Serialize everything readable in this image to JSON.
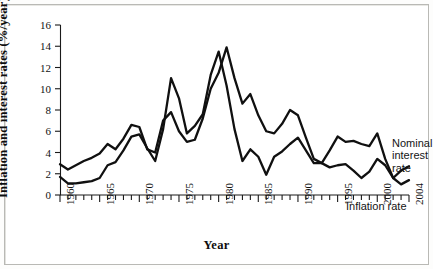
{
  "figure": {
    "ylabel": "Inflation and interest rates (%/year)",
    "xlabel": "Year",
    "annotations": {
      "nominal": "Nominal\ninterest rate",
      "inflation": "Inflation rate"
    }
  },
  "chart_data": {
    "type": "line",
    "title": "",
    "xlabel": "Year",
    "ylabel": "Inflation and interest rates (%/year)",
    "xlim": [
      1960,
      2004
    ],
    "ylim": [
      0,
      16
    ],
    "ytick_labels": [
      "0",
      "2",
      "4",
      "6",
      "8",
      "10",
      "12",
      "14",
      "16"
    ],
    "yticks": [
      0,
      2,
      4,
      6,
      8,
      10,
      12,
      14,
      16
    ],
    "xtick_labels": [
      "1960",
      "1965",
      "1970",
      "1975",
      "1980",
      "1985",
      "1990",
      "1995",
      "2000",
      "2004"
    ],
    "xticks": [
      1960,
      1965,
      1970,
      1975,
      1980,
      1985,
      1990,
      1995,
      2000,
      2004
    ],
    "minor_xtick_interval": 1,
    "grid": false,
    "legend": "annotated-inline",
    "x": [
      1960,
      1961,
      1962,
      1963,
      1964,
      1965,
      1966,
      1967,
      1968,
      1969,
      1970,
      1971,
      1972,
      1973,
      1974,
      1975,
      1976,
      1977,
      1978,
      1979,
      1980,
      1981,
      1982,
      1983,
      1984,
      1985,
      1986,
      1987,
      1988,
      1989,
      1990,
      1991,
      1992,
      1993,
      1994,
      1995,
      1996,
      1997,
      1998,
      1999,
      2000,
      2001,
      2002,
      2003,
      2004
    ],
    "series": [
      {
        "name": "Nominal interest rate",
        "color": "#101010",
        "values": [
          2.9,
          2.4,
          2.8,
          3.2,
          3.5,
          3.9,
          4.8,
          4.3,
          5.3,
          6.6,
          6.4,
          4.3,
          4.0,
          7.0,
          7.8,
          6.0,
          5.0,
          5.2,
          7.2,
          10.0,
          11.5,
          13.9,
          11.0,
          8.6,
          9.5,
          7.5,
          6.0,
          5.8,
          6.7,
          8.0,
          7.5,
          5.4,
          3.4,
          3.0,
          4.2,
          5.5,
          5.0,
          5.1,
          4.8,
          4.6,
          5.8,
          3.4,
          1.6,
          1.0,
          1.4
        ]
      },
      {
        "name": "Inflation rate",
        "color": "#101010",
        "values": [
          1.7,
          1.1,
          1.1,
          1.2,
          1.3,
          1.6,
          2.8,
          3.1,
          4.2,
          5.5,
          5.7,
          4.4,
          3.2,
          6.2,
          11.0,
          9.1,
          5.8,
          6.5,
          7.6,
          11.3,
          13.5,
          10.3,
          6.2,
          3.2,
          4.3,
          3.6,
          1.9,
          3.6,
          4.1,
          4.8,
          5.4,
          4.2,
          3.0,
          3.0,
          2.6,
          2.8,
          2.9,
          2.3,
          1.6,
          2.2,
          3.4,
          2.8,
          1.6,
          2.3,
          2.7
        ]
      }
    ]
  }
}
